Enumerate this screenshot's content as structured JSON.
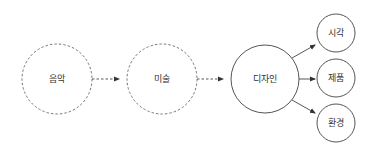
{
  "diagram": {
    "colors": {
      "stroke": "#555555",
      "text": "#333333",
      "background": "#ffffff"
    },
    "nodes": [
      {
        "id": "music",
        "label": "음악",
        "style": "dashed"
      },
      {
        "id": "art",
        "label": "미술",
        "style": "dashed"
      },
      {
        "id": "design",
        "label": "디자인",
        "style": "solid"
      },
      {
        "id": "visual",
        "label": "시각",
        "style": "solid"
      },
      {
        "id": "product",
        "label": "제품",
        "style": "solid"
      },
      {
        "id": "environment",
        "label": "환경",
        "style": "solid"
      }
    ],
    "edges": [
      {
        "from": "music",
        "to": "art",
        "style": "dashed"
      },
      {
        "from": "art",
        "to": "design",
        "style": "dashed"
      },
      {
        "from": "design",
        "to": "visual",
        "style": "solid"
      },
      {
        "from": "design",
        "to": "product",
        "style": "solid"
      },
      {
        "from": "design",
        "to": "environment",
        "style": "solid"
      }
    ]
  }
}
